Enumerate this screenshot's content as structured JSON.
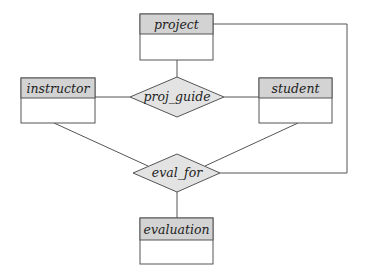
{
  "diagram": {
    "type": "ER diagram",
    "colors": {
      "line": "#555555",
      "entity_header_fill": "#d3d3d3",
      "entity_body_fill": "#ffffff",
      "relationship_fill": "#e3e3e3",
      "text": "#222222"
    },
    "entities": [
      {
        "id": "project",
        "label": "project"
      },
      {
        "id": "instructor",
        "label": "instructor"
      },
      {
        "id": "student",
        "label": "student"
      },
      {
        "id": "evaluation",
        "label": "evaluation"
      }
    ],
    "relationships": [
      {
        "id": "proj_guide",
        "label": "proj_guide",
        "connects": [
          "project",
          "instructor",
          "student"
        ]
      },
      {
        "id": "eval_for",
        "label": "eval_for",
        "connects": [
          "instructor",
          "student",
          "project",
          "evaluation"
        ]
      }
    ]
  }
}
